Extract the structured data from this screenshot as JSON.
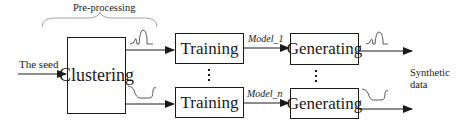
{
  "diagram": {
    "title_bracket_label": "Pre-processing",
    "input_label": "The seed",
    "output_label": "Synthetic data",
    "nodes": {
      "clustering": "Clustering",
      "training_top": "Training",
      "training_bottom": "Training",
      "generating_top": "Generating",
      "generating_bottom": "Generating"
    },
    "edge_labels": {
      "model_top": "Model_1",
      "model_bottom": "Model_n"
    },
    "ellipsis": "⋮"
  }
}
